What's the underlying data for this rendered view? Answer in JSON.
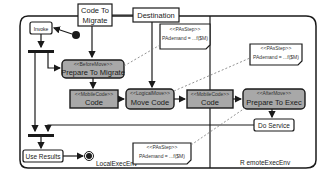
{
  "diagram": {
    "type": "UML activity diagram (code migration)",
    "partitions": [
      {
        "id": "local",
        "label": "LocalExecEnv"
      },
      {
        "id": "remote",
        "label": "R emoteExecEnv"
      }
    ],
    "object_nodes": [
      {
        "id": "code_to_migrate",
        "label_line1": "Code To",
        "label_line2": "Migrate"
      },
      {
        "id": "destination",
        "label": "Destination"
      }
    ],
    "actions": [
      {
        "id": "invoke",
        "label": "Invoke"
      },
      {
        "id": "prepare_to_migrate",
        "stereotype": "<<BeforeMove>>",
        "label": "Prepare To Migrate"
      },
      {
        "id": "code_local",
        "stereotype": "<<MobileCode>>",
        "label": "Code"
      },
      {
        "id": "move_code",
        "stereotype": "<<LogicalMove>>",
        "label": "Move Code"
      },
      {
        "id": "code_remote",
        "stereotype": "<<MobileCode>>",
        "label": "Code"
      },
      {
        "id": "prepare_to_exec",
        "stereotype": "<<AfterMove>>",
        "label": "Prepare To Exec"
      },
      {
        "id": "do_service",
        "label": "Do Service"
      },
      {
        "id": "use_results",
        "label": "Use Results"
      }
    ],
    "notes": [
      {
        "id": "note_top",
        "stereotype": "<<PAsStep>>",
        "text": "PAdemand = ...f($M)"
      },
      {
        "id": "note_right",
        "stereotype": "<<PAsStep>>",
        "text": "PAdemand = ...f($M)"
      },
      {
        "id": "note_bottom",
        "stereotype": "<<PAsStep>>",
        "text": "PAdemand = ...f($M)"
      }
    ],
    "colors": {
      "stroke": "#1a1a1a",
      "action_fill_gray": "#a8a8a8",
      "action_fill_white": "#ffffff",
      "dashed_link": "#777777"
    }
  }
}
